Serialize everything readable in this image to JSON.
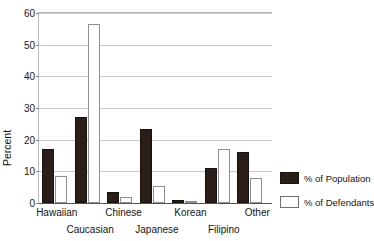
{
  "chart_data": {
    "type": "bar",
    "title": "",
    "title_fragment": "",
    "xlabel": "",
    "ylabel": "Percent",
    "ylim": [
      0,
      60
    ],
    "yticks": [
      0,
      10,
      20,
      30,
      40,
      50,
      60
    ],
    "ytick_labels": [
      "0",
      "10",
      "20",
      "30",
      "40",
      "50",
      "60"
    ],
    "grid": true,
    "grid_axis": "y",
    "legend_position": "right",
    "categories": [
      "Hawaiian",
      "Caucasian",
      "Chinese",
      "Japanese",
      "Korean",
      "Filipino",
      "Other"
    ],
    "category_label_rows": [
      0,
      1,
      0,
      1,
      0,
      1,
      0
    ],
    "series": [
      {
        "name": "% of Population",
        "color": "#2b1d18",
        "values": [
          17,
          26.8,
          3.4,
          23,
          1,
          11,
          16
        ]
      },
      {
        "name": "% of Defendants",
        "color": "#ffffff",
        "values": [
          8.5,
          56,
          1.8,
          5.3,
          0.5,
          17,
          7.8
        ]
      }
    ]
  },
  "legend": {
    "entries": [
      {
        "label": "% of Population"
      },
      {
        "label": "% of Defendants"
      }
    ]
  },
  "colors": {
    "population": "#2b1d18",
    "defendants": "#ffffff",
    "axis": "#555555",
    "grid": "#c9c9c9",
    "text": "#141414"
  }
}
